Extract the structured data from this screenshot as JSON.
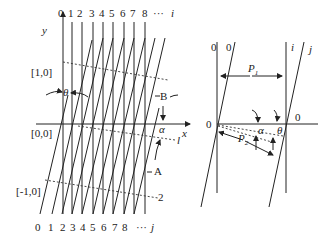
{
  "left_diagram": {
    "axis_x_label": "x",
    "axis_y_label": "y",
    "top_labels": [
      "0",
      "1",
      "2",
      "3",
      "4",
      "5",
      "6",
      "7",
      "8",
      "···",
      "i"
    ],
    "bottom_labels": [
      "0",
      "1",
      "2",
      "3",
      "4",
      "5",
      "6",
      "7",
      "8",
      "···",
      "j"
    ],
    "row_labels": [
      "[1,0]",
      "[0,0]",
      "[-1,0]"
    ],
    "angle_theta": "θ",
    "angle_alpha": "α",
    "line_label_B": "B",
    "line_label_A": "A",
    "line_label_l": "l",
    "line_label_2": "2"
  },
  "right_diagram": {
    "top_left_labels": [
      "0",
      "0"
    ],
    "top_right_labels": [
      "i",
      "j"
    ],
    "origin_left": "0",
    "origin_right": "0",
    "period_1": "P",
    "period_1_sub": "1",
    "period_2": "P",
    "period_2_sub": "2",
    "angle_alpha": "α",
    "angle_theta": "θ"
  }
}
